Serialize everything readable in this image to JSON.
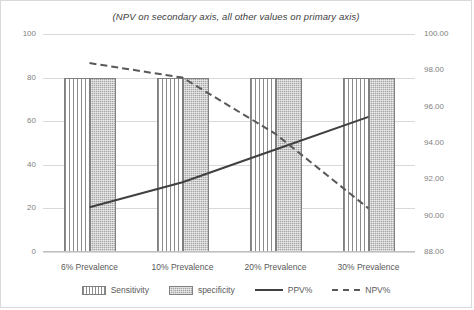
{
  "chart_data": {
    "type": "bar",
    "title": "(NPV on secondary axis, all other values on primary axis)",
    "xlabel": "",
    "ylabel": "",
    "categories": [
      "6% Prevalence",
      "10% Prevalence",
      "20% Prevalence",
      "30% Prevalence"
    ],
    "primary_axis": {
      "ticks": [
        "0",
        "20",
        "40",
        "60",
        "80",
        "100"
      ],
      "ylim": [
        0,
        100
      ]
    },
    "secondary_axis": {
      "ticks": [
        "88.00",
        "90.00",
        "92.00",
        "94.00",
        "96.00",
        "98.00",
        "100.00"
      ],
      "ylim": [
        88,
        100
      ]
    },
    "grid": true,
    "legend_position": "bottom",
    "series": [
      {
        "name": "Sensitivity",
        "axis": "primary",
        "type": "bar",
        "pattern": "vertical-stripes",
        "color": "#8c8c8c",
        "values": [
          80,
          80,
          80,
          80
        ]
      },
      {
        "name": "specificity",
        "axis": "primary",
        "type": "bar",
        "pattern": "dotted-gray",
        "color": "#a6a6a6",
        "values": [
          80,
          80,
          80,
          80
        ]
      },
      {
        "name": "PPV%",
        "axis": "primary",
        "type": "line",
        "style": "solid",
        "color": "#404040",
        "values": [
          20.5,
          32.0,
          47.0,
          62.0
        ]
      },
      {
        "name": "NPV%",
        "axis": "secondary",
        "type": "line",
        "style": "dashed",
        "color": "#595959",
        "values": [
          98.4,
          97.6,
          94.5,
          90.4
        ]
      }
    ]
  },
  "colors": {
    "grid": "#d9d9d9",
    "axis_text": "#7f7f7f",
    "label_text": "#595959",
    "frame": "#d9d9d9",
    "background": "#ffffff"
  }
}
